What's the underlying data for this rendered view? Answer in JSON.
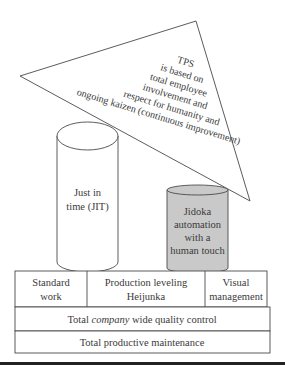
{
  "roof": {
    "lines": [
      "TPS",
      "is based on",
      "total employee",
      "involvement and",
      "respect for humanity and",
      "ongoing kaizen (continuous improvement)"
    ]
  },
  "pillars": {
    "left": {
      "line1": "Just in",
      "line2": "time (JIT)"
    },
    "right": {
      "line1": "Jidoka",
      "line2": "automation",
      "line3": "with a",
      "line4": "human touch",
      "fill": "#c9c9c9"
    }
  },
  "foundation": {
    "row1": {
      "cells": [
        {
          "line1": "Standard",
          "line2": "work"
        },
        {
          "line1": "Production leveling",
          "line2": "Heijunka"
        },
        {
          "line1": "Visual",
          "line2": "management"
        }
      ]
    },
    "row2": {
      "prefix": "Total ",
      "italic": "company",
      "suffix": " wide quality control"
    },
    "row3": {
      "label": "Total productive maintenance"
    }
  },
  "colors": {
    "stroke": "#4a4a4a",
    "gray_pillar": "#c9c9c9",
    "rule": "#222222"
  }
}
